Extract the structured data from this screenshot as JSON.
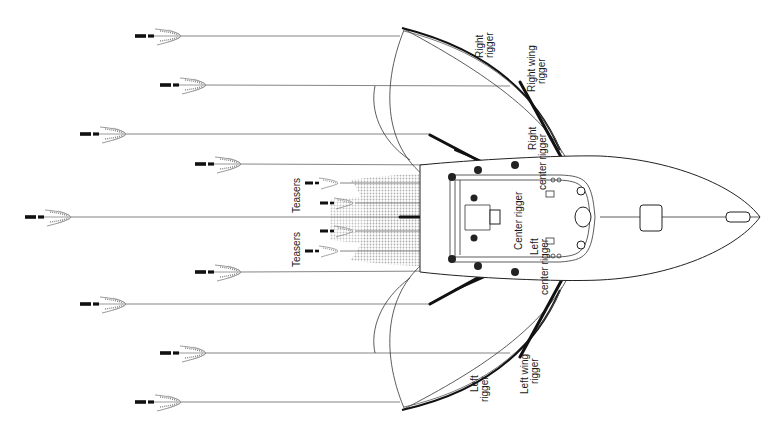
{
  "diagram": {
    "colors": {
      "background": "#ffffff",
      "ink": "#111111",
      "line": "#777777",
      "wake": "#c8c8c8"
    },
    "labels": {
      "right_rigger": [
        "Right",
        "rigger"
      ],
      "right_wing_rigger": [
        "Right wing",
        "rigger"
      ],
      "right_center_rigger": [
        "Right",
        "center rigger"
      ],
      "center_rigger": "Center rigger",
      "left_center_rigger": [
        "Left",
        "center rigger"
      ],
      "left_wing_rigger": [
        "Left wing",
        "rigger"
      ],
      "left_rigger": [
        "Left",
        "rigger"
      ],
      "teasers_top": "Teasers",
      "teasers_bottom": "Teasers"
    },
    "lures": [
      {
        "name": "lure-right-rigger",
        "x": 135,
        "y": 36
      },
      {
        "name": "lure-right-wing-rigger",
        "x": 160,
        "y": 85
      },
      {
        "name": "lure-right-outer-flat",
        "x": 80,
        "y": 134
      },
      {
        "name": "lure-right-center-rigger",
        "x": 195,
        "y": 164
      },
      {
        "name": "lure-center-rigger",
        "x": 25,
        "y": 217
      },
      {
        "name": "lure-left-center-rigger",
        "x": 195,
        "y": 272
      },
      {
        "name": "lure-left-outer-flat",
        "x": 80,
        "y": 304
      },
      {
        "name": "lure-left-wing-rigger",
        "x": 160,
        "y": 353
      },
      {
        "name": "lure-left-rigger",
        "x": 135,
        "y": 402
      }
    ],
    "teasers": [
      {
        "name": "teaser-right-outer",
        "x": 305,
        "y": 183
      },
      {
        "name": "teaser-right-inner",
        "x": 320,
        "y": 203
      },
      {
        "name": "teaser-left-inner",
        "x": 320,
        "y": 231
      },
      {
        "name": "teaser-left-outer",
        "x": 305,
        "y": 251
      }
    ]
  }
}
